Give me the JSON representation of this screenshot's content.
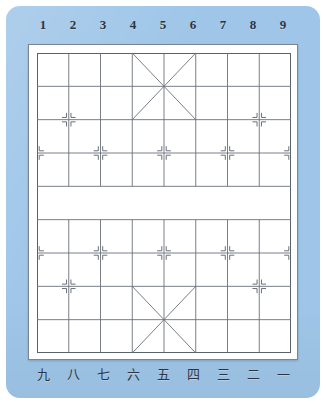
{
  "board": {
    "game": "xiangqi",
    "title": "Xiangqi board",
    "colors": {
      "mat": "#9fc6e8",
      "board": "#ffffff",
      "line": "#6a7079",
      "frame": "#7b8490",
      "label": "#2d3440"
    },
    "geometry": {
      "files": 9,
      "ranks": 10,
      "river_between_ranks": [
        5,
        6
      ],
      "palace_files": [
        4,
        5,
        6
      ],
      "palace_top_ranks": [
        1,
        2,
        3
      ],
      "palace_bottom_ranks": [
        8,
        9,
        10
      ]
    },
    "top_labels": [
      "1",
      "2",
      "3",
      "4",
      "5",
      "6",
      "7",
      "8",
      "9"
    ],
    "bottom_labels": [
      "九",
      "八",
      "七",
      "六",
      "五",
      "四",
      "三",
      "二",
      "一"
    ],
    "star_points": {
      "cannon_rank_top": 3,
      "cannon_files": [
        2,
        8
      ],
      "pawn_rank_top": 4,
      "pawn_files": [
        1,
        3,
        5,
        7,
        9
      ],
      "cannon_rank_bottom": 8,
      "pawn_rank_bottom": 7
    }
  }
}
